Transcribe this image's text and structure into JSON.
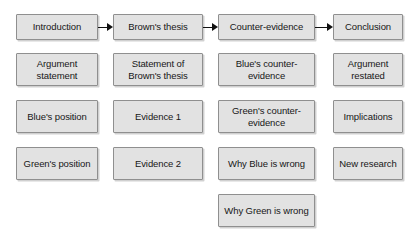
{
  "diagram": {
    "type": "flowchart",
    "orientation": "left-to-right header flow with stacked detail boxes",
    "colors": {
      "box_fill": "#e2e2e2",
      "box_border": "#8f8f8f",
      "text": "#171717",
      "arrow": "#111111",
      "background": "#ffffff"
    },
    "columns": [
      {
        "header": "Introduction",
        "items": [
          "Argument statement",
          "Blue's position",
          "Green's position"
        ]
      },
      {
        "header": "Brown's thesis",
        "items": [
          "Statement of Brown's thesis",
          "Evidence 1",
          "Evidence 2"
        ]
      },
      {
        "header": "Counter-evidence",
        "items": [
          "Blue's counter-evidence",
          "Green's counter-evidence",
          "Why Blue is wrong",
          "Why Green is wrong"
        ]
      },
      {
        "header": "Conclusion",
        "items": [
          "Argument restated",
          "Implications",
          "New research"
        ]
      }
    ],
    "arrows": [
      {
        "from": "Introduction",
        "to": "Brown's thesis",
        "glyph": "arrow-right-icon"
      },
      {
        "from": "Brown's thesis",
        "to": "Counter-evidence",
        "glyph": "arrow-right-icon"
      },
      {
        "from": "Counter-evidence",
        "to": "Conclusion",
        "glyph": "arrow-right-icon"
      }
    ]
  }
}
